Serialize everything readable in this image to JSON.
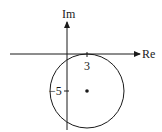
{
  "diagram": {
    "axes": {
      "real_label": "Re",
      "imag_label": "Im"
    },
    "ticks": {
      "real_tick": "3",
      "imag_tick": "−5"
    },
    "circle": {
      "center": {
        "re": 3,
        "im": -5
      },
      "radius": 5,
      "center_marker": "dot"
    },
    "colors": {
      "stroke": "#1a1a1a",
      "background": "#ffffff"
    }
  }
}
